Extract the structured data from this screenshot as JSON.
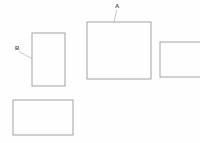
{
  "diagram": {
    "background_color": "#fefefe",
    "stroke_color": "#9a9a9a",
    "leader_color": "#b0b0b0",
    "label_color": "#5a5a5a",
    "canvas": {
      "width": 200,
      "height": 143
    },
    "shapes": [
      {
        "id": "rect-b",
        "name": "left-upper-rectangle",
        "x": 32,
        "y": 33,
        "width": 33,
        "height": 53,
        "labeled_by": "B"
      },
      {
        "id": "rect-a",
        "name": "center-large-rectangle",
        "x": 87,
        "y": 22,
        "width": 64,
        "height": 57,
        "labeled_by": "A"
      },
      {
        "id": "rect-right",
        "name": "right-clipped-rectangle",
        "x": 160,
        "y": 42,
        "width": 48,
        "height": 35,
        "labeled_by": ""
      },
      {
        "id": "rect-bottom",
        "name": "bottom-left-rectangle",
        "x": 13,
        "y": 100,
        "width": 60,
        "height": 35,
        "labeled_by": ""
      }
    ],
    "callouts": [
      {
        "id": "callout-a",
        "label": "A",
        "label_x": 115,
        "label_y": 8,
        "leader_path": "M 116.5 10 C 116.2 14, 114.8 18, 114 22",
        "target_shape": "rect-a"
      },
      {
        "id": "callout-b",
        "label": "B",
        "label_x": 15,
        "label_y": 50,
        "leader_path": "M 19 51.5 C 23 54, 28 56.5, 32 58.5",
        "target_shape": "rect-b"
      }
    ]
  }
}
